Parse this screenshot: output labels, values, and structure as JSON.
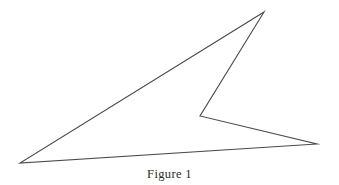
{
  "figure": {
    "caption": "Figure 1",
    "background_color": "#ffffff",
    "stroke_color": "#4a4a4a",
    "stroke_width": 1.1,
    "fill": "none",
    "canvas": {
      "width": 339,
      "height": 185
    },
    "shape_name": "non-convex-quadrilateral-dart",
    "vertices": [
      {
        "label": "top-apex",
        "x": 264,
        "y": 12
      },
      {
        "label": "reflex-notch",
        "x": 200,
        "y": 116
      },
      {
        "label": "right-tip",
        "x": 317,
        "y": 144
      },
      {
        "label": "bottom-left-tip",
        "x": 20,
        "y": 163
      }
    ],
    "edges": [
      {
        "from": "top-apex",
        "to": "reflex-notch"
      },
      {
        "from": "reflex-notch",
        "to": "right-tip"
      },
      {
        "from": "right-tip",
        "to": "bottom-left-tip"
      },
      {
        "from": "bottom-left-tip",
        "to": "top-apex"
      }
    ],
    "path_d": "M 264 12 L 200 116 L 317 144 L 20 163 Z"
  }
}
